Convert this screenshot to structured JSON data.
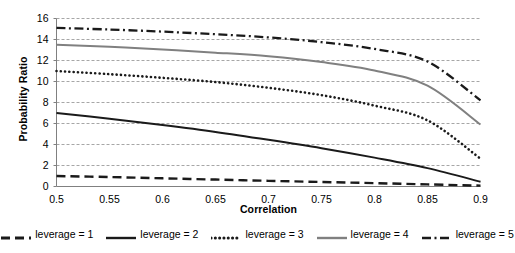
{
  "chart_data": {
    "type": "line",
    "title": "",
    "xlabel": "Correlation",
    "ylabel": "Probability Ratio",
    "xlim": [
      0.5,
      0.9
    ],
    "ylim": [
      0,
      16
    ],
    "xticks": [
      "0.5",
      "0.55",
      "0.6",
      "0.65",
      "0.7",
      "0.75",
      "0.8",
      "0.85",
      "0.9"
    ],
    "yticks": [
      "0",
      "2",
      "4",
      "6",
      "8",
      "10",
      "12",
      "14",
      "16"
    ],
    "grid": "horizontal-dashed",
    "legend_position": "bottom",
    "x": [
      0.5,
      0.55,
      0.6,
      0.65,
      0.7,
      0.75,
      0.8,
      0.85,
      0.9
    ],
    "series": [
      {
        "name": "leverage = 1",
        "style": "dashed",
        "color": "#1a1a1a",
        "values": [
          1.0,
          0.9,
          0.78,
          0.66,
          0.54,
          0.43,
          0.32,
          0.2,
          0.08
        ]
      },
      {
        "name": "leverage = 2",
        "style": "solid",
        "color": "#1a1a1a",
        "values": [
          7.0,
          6.45,
          5.85,
          5.2,
          4.45,
          3.65,
          2.75,
          1.75,
          0.45
        ]
      },
      {
        "name": "leverage = 3",
        "style": "dotted",
        "color": "#1a1a1a",
        "values": [
          11.0,
          10.7,
          10.35,
          9.95,
          9.4,
          8.7,
          7.7,
          6.3,
          2.65
        ]
      },
      {
        "name": "leverage = 4",
        "style": "solid",
        "color": "#808080",
        "values": [
          13.5,
          13.3,
          13.05,
          12.75,
          12.4,
          11.85,
          11.05,
          9.6,
          5.9
        ]
      },
      {
        "name": "leverage = 5",
        "style": "dash-dot",
        "color": "#1a1a1a",
        "values": [
          15.1,
          14.95,
          14.75,
          14.5,
          14.2,
          13.75,
          13.1,
          11.9,
          8.2
        ]
      }
    ]
  },
  "legend": {
    "items": [
      {
        "label": "leverage = 1"
      },
      {
        "label": "leverage = 2"
      },
      {
        "label": "leverage = 3"
      },
      {
        "label": "leverage = 4"
      },
      {
        "label": "leverage = 5"
      }
    ]
  },
  "colors": {
    "gridline": "#a6a6a6",
    "axis": "#808080",
    "text": "#000000"
  }
}
